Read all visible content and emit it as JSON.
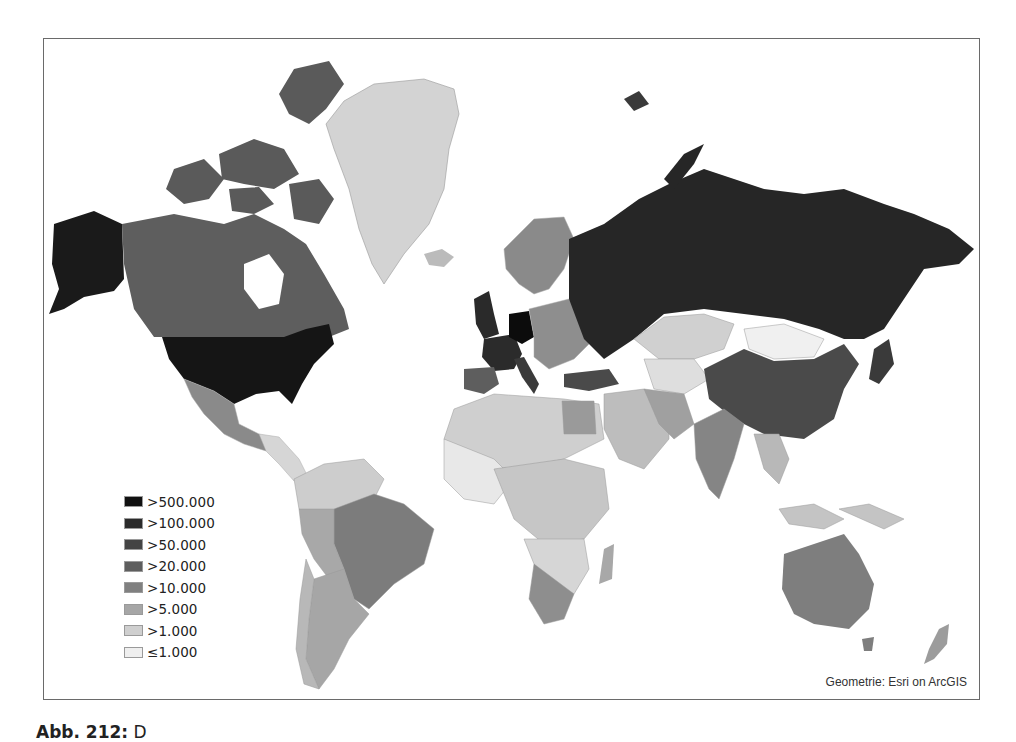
{
  "map": {
    "legend": {
      "items": [
        {
          "label": ">500.000",
          "color": "#111111"
        },
        {
          "label": ">100.000",
          "color": "#2b2b2b"
        },
        {
          "label": ">50.000",
          "color": "#444444"
        },
        {
          "label": ">20.000",
          "color": "#5e5e5e"
        },
        {
          "label": ">10.000",
          "color": "#808080"
        },
        {
          "label": ">5.000",
          "color": "#a6a6a6"
        },
        {
          "label": ">1.000",
          "color": "#cfcfcf"
        },
        {
          "label": "≤1.000",
          "color": "#efefef"
        }
      ]
    },
    "attribution": "Geometrie: Esri on ArcGIS",
    "regions": [
      {
        "name": "USA",
        "class": ">500.000"
      },
      {
        "name": "Germany",
        "class": ">500.000"
      },
      {
        "name": "Alaska (USA)",
        "class": ">500.000"
      },
      {
        "name": "Russia",
        "class": ">100.000"
      },
      {
        "name": "United Kingdom",
        "class": ">100.000"
      },
      {
        "name": "France",
        "class": ">100.000"
      },
      {
        "name": "China",
        "class": ">50.000"
      },
      {
        "name": "Canada",
        "class": ">50.000"
      },
      {
        "name": "Turkey",
        "class": ">50.000"
      },
      {
        "name": "Brazil",
        "class": ">20.000"
      },
      {
        "name": "Australia",
        "class": ">20.000"
      },
      {
        "name": "India",
        "class": ">20.000"
      },
      {
        "name": "Mexico",
        "class": ">20.000"
      },
      {
        "name": "Greenland",
        "class": ">1.000"
      },
      {
        "name": "Kazakhstan",
        "class": ">1.000"
      },
      {
        "name": "Mongolia",
        "class": "≤1.000"
      }
    ]
  },
  "caption": {
    "prefix": "Abb. 212:",
    "text": " D"
  }
}
